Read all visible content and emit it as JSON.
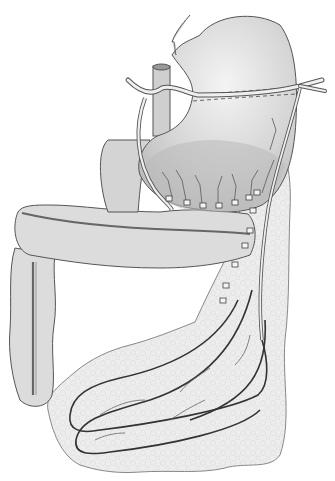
{
  "figure": {
    "type": "anatomical-illustration",
    "labels": [],
    "colors": {
      "background": "#ffffff",
      "organ_fill": "#d9d9d9",
      "organ_dark": "#b8b8b8",
      "omentum_fill": "#ececec",
      "outline": "#555555",
      "vessel": "#333333"
    },
    "parts": [
      "stomach",
      "esophagus",
      "aorta",
      "transverse-colon",
      "ascending-colon",
      "greater-omentum",
      "gastroepiploic-vessels",
      "ligated-vessel-clips"
    ]
  }
}
